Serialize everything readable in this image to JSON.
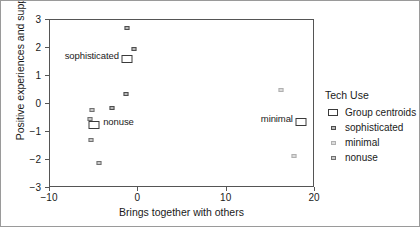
{
  "chart_data": {
    "type": "scatter",
    "title": "",
    "xlabel": "Brings together with others",
    "ylabel": "Positive experiences and support",
    "xlim": [
      -10,
      20
    ],
    "ylim": [
      -3,
      3
    ],
    "xticks": [
      "-10",
      "0",
      "10",
      "20"
    ],
    "xtick_values": [
      -10,
      0,
      10,
      20
    ],
    "yticks": [
      "3",
      "2",
      "1",
      "0",
      "-1",
      "-2",
      "-3"
    ],
    "ytick_values": [
      3,
      2,
      1,
      0,
      -1,
      -2,
      -3
    ],
    "grid": false,
    "legend": {
      "title": "Tech Use",
      "position": "right",
      "entries": [
        {
          "label": "Group centroids",
          "key": "centroid"
        },
        {
          "label": "sophisticated",
          "key": "sophisticated"
        },
        {
          "label": "minimal",
          "key": "minimal"
        },
        {
          "label": "nonuse",
          "key": "nonuse"
        }
      ]
    },
    "series": [
      {
        "name": "sophisticated",
        "marker": "sophisticated",
        "points": [
          {
            "x": -1.3,
            "y": 2.7
          },
          {
            "x": -0.5,
            "y": 1.95
          },
          {
            "x": -1.4,
            "y": 0.35
          },
          {
            "x": -3.0,
            "y": -0.15
          }
        ]
      },
      {
        "name": "minimal",
        "marker": "minimal",
        "points": [
          {
            "x": 16.2,
            "y": 0.5
          },
          {
            "x": 17.6,
            "y": -1.85
          }
        ]
      },
      {
        "name": "nonuse",
        "marker": "nonuse",
        "points": [
          {
            "x": -5.3,
            "y": -0.2
          },
          {
            "x": -5.5,
            "y": -0.55
          },
          {
            "x": -5.4,
            "y": -1.3
          },
          {
            "x": -4.5,
            "y": -2.1
          }
        ]
      },
      {
        "name": "Group centroids",
        "marker": "centroid",
        "points": [
          {
            "x": -1.3,
            "y": 1.6,
            "label": "sophisticated",
            "label_side": "left"
          },
          {
            "x": -5.0,
            "y": -0.75,
            "label": "nonuse",
            "label_side": "right"
          },
          {
            "x": 18.4,
            "y": -0.65,
            "label": "minimal",
            "label_side": "left"
          }
        ]
      }
    ]
  }
}
